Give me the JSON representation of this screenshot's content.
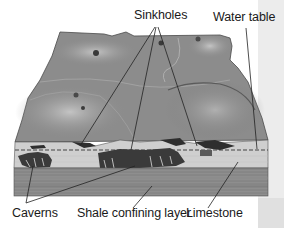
{
  "figure": {
    "labels": {
      "sinkholes": "Sinkholes",
      "water_table": "Water table",
      "caverns": "Caverns",
      "shale": "Shale confining layer",
      "limestone": "Limestone"
    },
    "colors": {
      "terrain": "#8c8c8c",
      "terrain_highlight": "#b5b5b5",
      "limestone": "#cfcfcf",
      "shale": "#8a8a8a",
      "cavern": "#2e2e2e",
      "leader_line": "#222222",
      "side_strip": "#ececec"
    }
  }
}
